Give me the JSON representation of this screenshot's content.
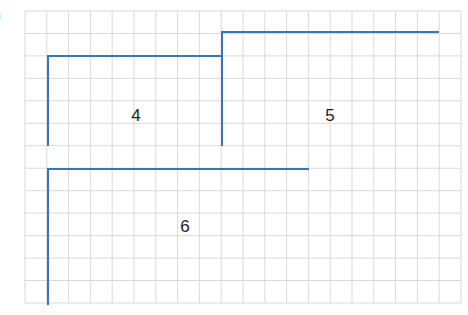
{
  "exercise_marker": ")",
  "grid": {
    "x0": 25,
    "y0": 11,
    "cols": 20,
    "rows": 13,
    "cell_w": 21.8,
    "cell_h": 22.46,
    "line_color": "#d9d9dc"
  },
  "line_color": "#3b73b9",
  "shapes": [
    {
      "label": "4",
      "label_pos": [
        136,
        116
      ],
      "points": [
        [
          48,
          146
        ],
        [
          48,
          56
        ],
        [
          222,
          56
        ]
      ]
    },
    {
      "label": "5",
      "label_pos": [
        330,
        116
      ],
      "points": [
        [
          222,
          146
        ],
        [
          222,
          32
        ],
        [
          439,
          32
        ]
      ]
    },
    {
      "label": "6",
      "label_pos": [
        185,
        227
      ],
      "points": [
        [
          48,
          305
        ],
        [
          48,
          169
        ],
        [
          309,
          169
        ]
      ]
    }
  ]
}
